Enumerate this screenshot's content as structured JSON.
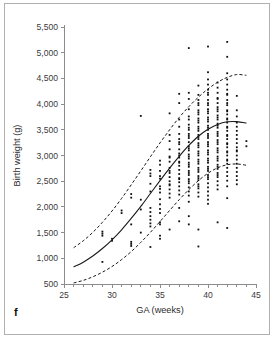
{
  "panel": {
    "label": "f"
  },
  "chart_data": {
    "type": "scatter",
    "title": "",
    "xlabel": "GA (weeks)",
    "ylabel": "Birth weight (g)",
    "xlim": [
      25,
      45
    ],
    "ylim": [
      500,
      5500
    ],
    "grid": false,
    "legend": null,
    "x_ticks": [
      25,
      30,
      35,
      40,
      45
    ],
    "x_tick_labels": [
      "25",
      "30",
      "35",
      "40",
      "45"
    ],
    "x_minor_tick_step": 1,
    "y_ticks": [
      500,
      1000,
      1500,
      2000,
      2500,
      3000,
      3500,
      4000,
      4500,
      5000,
      5500
    ],
    "y_tick_labels": [
      "500",
      "1,000",
      "1,500",
      "2,000",
      "2,500",
      "3,000",
      "3,500",
      "4,000",
      "4,500",
      "5,000",
      "5,500"
    ],
    "series": [
      {
        "name": "Upper reference curve (90th centile)",
        "style": "dashed",
        "x": [
          26,
          27,
          28,
          29,
          30,
          31,
          32,
          33,
          34,
          35,
          36,
          37,
          38,
          39,
          40,
          41,
          42,
          43,
          44
        ],
        "values": [
          1205,
          1340,
          1505,
          1700,
          1920,
          2165,
          2430,
          2700,
          2975,
          3245,
          3500,
          3740,
          3950,
          4135,
          4295,
          4425,
          4520,
          4575,
          4560
        ]
      },
      {
        "name": "Median curve (50th centile)",
        "style": "solid",
        "x": [
          26,
          27,
          28,
          29,
          30,
          31,
          32,
          33,
          34,
          35,
          36,
          37,
          38,
          39,
          40,
          41,
          42,
          43,
          44
        ],
        "values": [
          830,
          925,
          1045,
          1190,
          1360,
          1555,
          1775,
          2010,
          2260,
          2510,
          2755,
          2985,
          3195,
          3375,
          3510,
          3605,
          3655,
          3660,
          3630
        ]
      },
      {
        "name": "Lower reference curve (10th centile)",
        "style": "dashed",
        "x": [
          26,
          27,
          28,
          29,
          30,
          31,
          32,
          33,
          34,
          35,
          36,
          37,
          38,
          39,
          40,
          41,
          42,
          43,
          44
        ],
        "values": [
          520,
          570,
          640,
          730,
          840,
          975,
          1130,
          1310,
          1505,
          1715,
          1930,
          2140,
          2335,
          2510,
          2655,
          2760,
          2820,
          2835,
          2810
        ]
      }
    ],
    "points": [
      [
        29,
        1480
      ],
      [
        29,
        1440
      ],
      [
        29,
        1520
      ],
      [
        29,
        930
      ],
      [
        30,
        1340
      ],
      [
        30,
        1380
      ],
      [
        31,
        1880
      ],
      [
        31,
        1930
      ],
      [
        32,
        2180
      ],
      [
        32,
        1660
      ],
      [
        32,
        1320
      ],
      [
        32,
        1280
      ],
      [
        32,
        1240
      ],
      [
        32,
        2250
      ],
      [
        33,
        3770
      ],
      [
        33,
        1500
      ],
      [
        33,
        1950
      ],
      [
        33,
        2140
      ],
      [
        34,
        2650
      ],
      [
        34,
        2600
      ],
      [
        34,
        2300
      ],
      [
        34,
        1980
      ],
      [
        34,
        1900
      ],
      [
        34,
        1820
      ],
      [
        34,
        1750
      ],
      [
        34,
        1680
      ],
      [
        34,
        1620
      ],
      [
        34,
        1220
      ],
      [
        34,
        2720
      ],
      [
        34,
        2450
      ],
      [
        35,
        2820
      ],
      [
        35,
        2700
      ],
      [
        35,
        2550
      ],
      [
        35,
        2400
      ],
      [
        35,
        2280
      ],
      [
        35,
        2150
      ],
      [
        35,
        2050
      ],
      [
        35,
        1960
      ],
      [
        35,
        1880
      ],
      [
        35,
        1700
      ],
      [
        35,
        1660
      ],
      [
        35,
        1440
      ],
      [
        35,
        1380
      ],
      [
        35,
        2900
      ],
      [
        35,
        2600
      ],
      [
        35,
        2350
      ],
      [
        36,
        3820
      ],
      [
        36,
        3280
      ],
      [
        36,
        3120
      ],
      [
        36,
        2980
      ],
      [
        36,
        2880
      ],
      [
        36,
        2760
      ],
      [
        36,
        2660
      ],
      [
        36,
        2580
      ],
      [
        36,
        2500
      ],
      [
        36,
        2420
      ],
      [
        36,
        2340
      ],
      [
        36,
        2260
      ],
      [
        36,
        2180
      ],
      [
        36,
        1560
      ],
      [
        36,
        3400
      ],
      [
        36,
        2960
      ],
      [
        36,
        2700
      ],
      [
        36,
        2440
      ],
      [
        37,
        4200
      ],
      [
        37,
        4020
      ],
      [
        37,
        3560
      ],
      [
        37,
        3420
      ],
      [
        37,
        3320
      ],
      [
        37,
        3220
      ],
      [
        37,
        3120
      ],
      [
        37,
        3040
      ],
      [
        37,
        2960
      ],
      [
        37,
        2880
      ],
      [
        37,
        2800
      ],
      [
        37,
        2720
      ],
      [
        37,
        2640
      ],
      [
        37,
        2560
      ],
      [
        37,
        2480
      ],
      [
        37,
        2400
      ],
      [
        37,
        2320
      ],
      [
        37,
        2240
      ],
      [
        37,
        1980
      ],
      [
        37,
        1720
      ],
      [
        37,
        3700
      ],
      [
        37,
        3260
      ],
      [
        37,
        3000
      ],
      [
        37,
        2860
      ],
      [
        37,
        2540
      ],
      [
        38,
        5090
      ],
      [
        38,
        4220
      ],
      [
        38,
        4100
      ],
      [
        38,
        3900
      ],
      [
        38,
        3700
      ],
      [
        38,
        3600
      ],
      [
        38,
        3500
      ],
      [
        38,
        3420
      ],
      [
        38,
        3340
      ],
      [
        38,
        3260
      ],
      [
        38,
        3180
      ],
      [
        38,
        3100
      ],
      [
        38,
        3020
      ],
      [
        38,
        2940
      ],
      [
        38,
        2860
      ],
      [
        38,
        2780
      ],
      [
        38,
        2700
      ],
      [
        38,
        2620
      ],
      [
        38,
        2540
      ],
      [
        38,
        2460
      ],
      [
        38,
        2380
      ],
      [
        38,
        2300
      ],
      [
        38,
        2220
      ],
      [
        38,
        2100
      ],
      [
        38,
        1820
      ],
      [
        38,
        1660
      ],
      [
        38,
        3760
      ],
      [
        38,
        3540
      ],
      [
        38,
        3380
      ],
      [
        38,
        3140
      ],
      [
        38,
        2980
      ],
      [
        38,
        2820
      ],
      [
        38,
        2660
      ],
      [
        38,
        2500
      ],
      [
        39,
        4360
      ],
      [
        39,
        4180
      ],
      [
        39,
        4080
      ],
      [
        39,
        3980
      ],
      [
        39,
        3880
      ],
      [
        39,
        3800
      ],
      [
        39,
        3720
      ],
      [
        39,
        3640
      ],
      [
        39,
        3560
      ],
      [
        39,
        3480
      ],
      [
        39,
        3400
      ],
      [
        39,
        3320
      ],
      [
        39,
        3240
      ],
      [
        39,
        3160
      ],
      [
        39,
        3080
      ],
      [
        39,
        3000
      ],
      [
        39,
        2920
      ],
      [
        39,
        2840
      ],
      [
        39,
        2760
      ],
      [
        39,
        2680
      ],
      [
        39,
        2600
      ],
      [
        39,
        2520
      ],
      [
        39,
        2440
      ],
      [
        39,
        2360
      ],
      [
        39,
        2280
      ],
      [
        39,
        2200
      ],
      [
        39,
        1560
      ],
      [
        39,
        1230
      ],
      [
        39,
        4020
      ],
      [
        39,
        3840
      ],
      [
        39,
        3680
      ],
      [
        39,
        3520
      ],
      [
        39,
        3360
      ],
      [
        39,
        3200
      ],
      [
        39,
        3040
      ],
      [
        39,
        2880
      ],
      [
        39,
        2720
      ],
      [
        39,
        2560
      ],
      [
        39,
        2400
      ],
      [
        40,
        5120
      ],
      [
        40,
        4620
      ],
      [
        40,
        4480
      ],
      [
        40,
        4380
      ],
      [
        40,
        4280
      ],
      [
        40,
        4180
      ],
      [
        40,
        4080
      ],
      [
        40,
        3980
      ],
      [
        40,
        3900
      ],
      [
        40,
        3820
      ],
      [
        40,
        3740
      ],
      [
        40,
        3660
      ],
      [
        40,
        3580
      ],
      [
        40,
        3500
      ],
      [
        40,
        3420
      ],
      [
        40,
        3340
      ],
      [
        40,
        3260
      ],
      [
        40,
        3180
      ],
      [
        40,
        3100
      ],
      [
        40,
        3020
      ],
      [
        40,
        2940
      ],
      [
        40,
        2860
      ],
      [
        40,
        2780
      ],
      [
        40,
        2700
      ],
      [
        40,
        2620
      ],
      [
        40,
        2540
      ],
      [
        40,
        2460
      ],
      [
        40,
        2380
      ],
      [
        40,
        2300
      ],
      [
        40,
        2220
      ],
      [
        40,
        2140
      ],
      [
        40,
        2060
      ],
      [
        40,
        4220
      ],
      [
        40,
        4020
      ],
      [
        40,
        3860
      ],
      [
        40,
        3700
      ],
      [
        40,
        3540
      ],
      [
        40,
        3380
      ],
      [
        40,
        3220
      ],
      [
        40,
        3060
      ],
      [
        40,
        2900
      ],
      [
        40,
        2740
      ],
      [
        40,
        2580
      ],
      [
        41,
        4420
      ],
      [
        41,
        4320
      ],
      [
        41,
        4220
      ],
      [
        41,
        4120
      ],
      [
        41,
        4020
      ],
      [
        41,
        3940
      ],
      [
        41,
        3860
      ],
      [
        41,
        3780
      ],
      [
        41,
        3700
      ],
      [
        41,
        3620
      ],
      [
        41,
        3540
      ],
      [
        41,
        3460
      ],
      [
        41,
        3380
      ],
      [
        41,
        3300
      ],
      [
        41,
        3220
      ],
      [
        41,
        3140
      ],
      [
        41,
        3060
      ],
      [
        41,
        2980
      ],
      [
        41,
        2900
      ],
      [
        41,
        2820
      ],
      [
        41,
        2740
      ],
      [
        41,
        2660
      ],
      [
        41,
        2580
      ],
      [
        41,
        2500
      ],
      [
        41,
        2420
      ],
      [
        41,
        2340
      ],
      [
        41,
        1700
      ],
      [
        41,
        4100
      ],
      [
        41,
        3900
      ],
      [
        41,
        3740
      ],
      [
        41,
        3580
      ],
      [
        41,
        3420
      ],
      [
        41,
        3260
      ],
      [
        41,
        3100
      ],
      [
        41,
        2940
      ],
      [
        41,
        2780
      ],
      [
        41,
        2620
      ],
      [
        42,
        5210
      ],
      [
        42,
        4920
      ],
      [
        42,
        4600
      ],
      [
        42,
        4480
      ],
      [
        42,
        4380
      ],
      [
        42,
        4280
      ],
      [
        42,
        4180
      ],
      [
        42,
        4080
      ],
      [
        42,
        3980
      ],
      [
        42,
        3880
      ],
      [
        42,
        3800
      ],
      [
        42,
        3720
      ],
      [
        42,
        3640
      ],
      [
        42,
        3560
      ],
      [
        42,
        3480
      ],
      [
        42,
        3400
      ],
      [
        42,
        3320
      ],
      [
        42,
        3240
      ],
      [
        42,
        3160
      ],
      [
        42,
        3080
      ],
      [
        42,
        3000
      ],
      [
        42,
        2920
      ],
      [
        42,
        2840
      ],
      [
        42,
        2760
      ],
      [
        42,
        2680
      ],
      [
        42,
        2600
      ],
      [
        42,
        2510
      ],
      [
        42,
        2400
      ],
      [
        42,
        2170
      ],
      [
        42,
        1590
      ],
      [
        42,
        4200
      ],
      [
        42,
        4020
      ],
      [
        42,
        3860
      ],
      [
        42,
        3700
      ],
      [
        42,
        3540
      ],
      [
        42,
        3380
      ],
      [
        42,
        3220
      ],
      [
        42,
        3060
      ],
      [
        42,
        2900
      ],
      [
        43,
        4160
      ],
      [
        43,
        3880
      ],
      [
        43,
        3560
      ],
      [
        43,
        3480
      ],
      [
        43,
        3400
      ],
      [
        43,
        3320
      ],
      [
        43,
        3240
      ],
      [
        43,
        3160
      ],
      [
        43,
        3080
      ],
      [
        43,
        3000
      ],
      [
        43,
        2920
      ],
      [
        43,
        2840
      ],
      [
        43,
        2760
      ],
      [
        43,
        2680
      ],
      [
        43,
        2600
      ],
      [
        43,
        2520
      ],
      [
        43,
        2440
      ],
      [
        43,
        3760
      ],
      [
        43,
        3640
      ],
      [
        43,
        3100
      ],
      [
        44,
        3280
      ],
      [
        44,
        3180
      ]
    ]
  }
}
